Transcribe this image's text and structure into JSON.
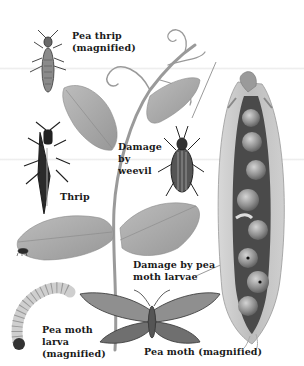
{
  "figure": {
    "labels": {
      "pea_thrip": "Pea thrip\n(magnified)",
      "pea_bean_weevil": "Pea and bean\nweevil\n(magnified)",
      "damage_by_weevil": "Damage\nby\nweevil",
      "thrip": "Thrip",
      "damage_by_larvae": "Damage by pea\nmoth larvae",
      "pea_moth_larva": "Pea moth\nlarva\n(magnified)",
      "pea_moth": "Pea moth (magnified)"
    },
    "colors": {
      "background": "#ffffff",
      "text": "#1a1a1a",
      "leaf": "#a9a9a9",
      "stem": "#9a9a9a",
      "insect_dark": "#2a2a2a",
      "pod_outer": "#bdbdbd",
      "pod_inner": "#4a4a4a",
      "pea": "#9c9c9c"
    }
  }
}
